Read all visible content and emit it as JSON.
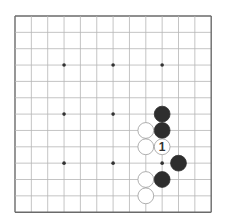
{
  "board": {
    "size": 13,
    "origin_x": 15,
    "origin_y": 16,
    "spacing": 16.35,
    "line_color": "#b5b5b5",
    "border_color": "#6a6a6a",
    "black_color": "#2e2e2e",
    "white_color": "#ffffff",
    "stone_outline": "#9a9a9a",
    "star_points": [
      [
        3,
        3
      ],
      [
        6,
        3
      ],
      [
        9,
        3
      ],
      [
        3,
        6
      ],
      [
        6,
        6
      ],
      [
        3,
        9
      ],
      [
        6,
        9
      ],
      [
        9,
        9
      ]
    ],
    "stones": [
      {
        "col": 9,
        "row": 6,
        "color": "black"
      },
      {
        "col": 9,
        "row": 7,
        "color": "black"
      },
      {
        "col": 8,
        "row": 7,
        "color": "white"
      },
      {
        "col": 8,
        "row": 8,
        "color": "white"
      },
      {
        "col": 9,
        "row": 8,
        "color": "white",
        "label": "1"
      },
      {
        "col": 10,
        "row": 9,
        "color": "black"
      },
      {
        "col": 8,
        "row": 10,
        "color": "white"
      },
      {
        "col": 9,
        "row": 10,
        "color": "black"
      },
      {
        "col": 8,
        "row": 11,
        "color": "white"
      }
    ]
  }
}
